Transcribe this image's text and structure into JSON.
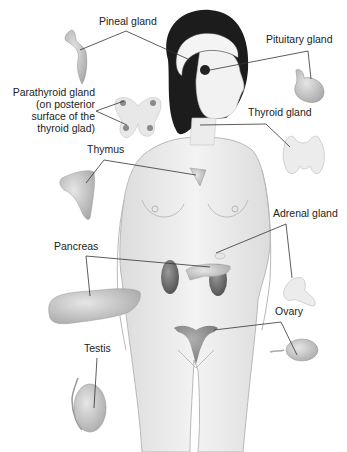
{
  "diagram": {
    "labels": {
      "pineal": "Pineal gland",
      "pituitary": "Pituitary gland",
      "parathyroid_line1": "Parathyroid gland",
      "parathyroid_line2": "(on posterior",
      "parathyroid_line3": "surface of the",
      "parathyroid_line4": "thyroid glad)",
      "thyroid": "Thyroid gland",
      "thymus": "Thymus",
      "adrenal": "Adrenal gland",
      "pancreas": "Pancreas",
      "ovary": "Ovary",
      "testis": "Testis"
    },
    "colors": {
      "skin": "#ededed",
      "skin_outline": "#b9b9b9",
      "hair": "#1c1c1c",
      "gland": "#cfcfcf",
      "gland_dark": "#8a8a8a",
      "kidney": "#6f6f6f",
      "leader_line": "#333333"
    }
  }
}
